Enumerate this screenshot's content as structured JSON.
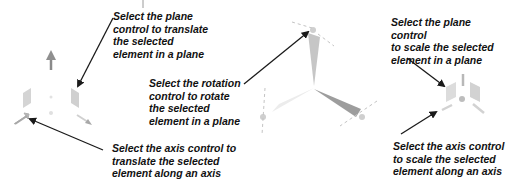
{
  "diagram": {
    "labels": {
      "translate_plane": "Select the plane\ncontrol to translate\nthe selected\nelement in a plane",
      "rotate_plane": "Select the rotation\ncontrol to rotate\nthe selected\nelement in a plane",
      "translate_axis": "Select the axis control to\ntranslate the selected\nelement along an axis",
      "scale_plane": "Select the plane control\nto scale the selected\nelement in a plane",
      "scale_axis": "Select the axis control\nto scale the selected\nelement along an axis"
    },
    "colors": {
      "text": "#111111",
      "arrow": "#1a1a1a",
      "gizmo_light": "#d4d4d4",
      "gizmo_mid": "#a8a8a8",
      "gizmo_dark": "#8a8a8a"
    }
  }
}
